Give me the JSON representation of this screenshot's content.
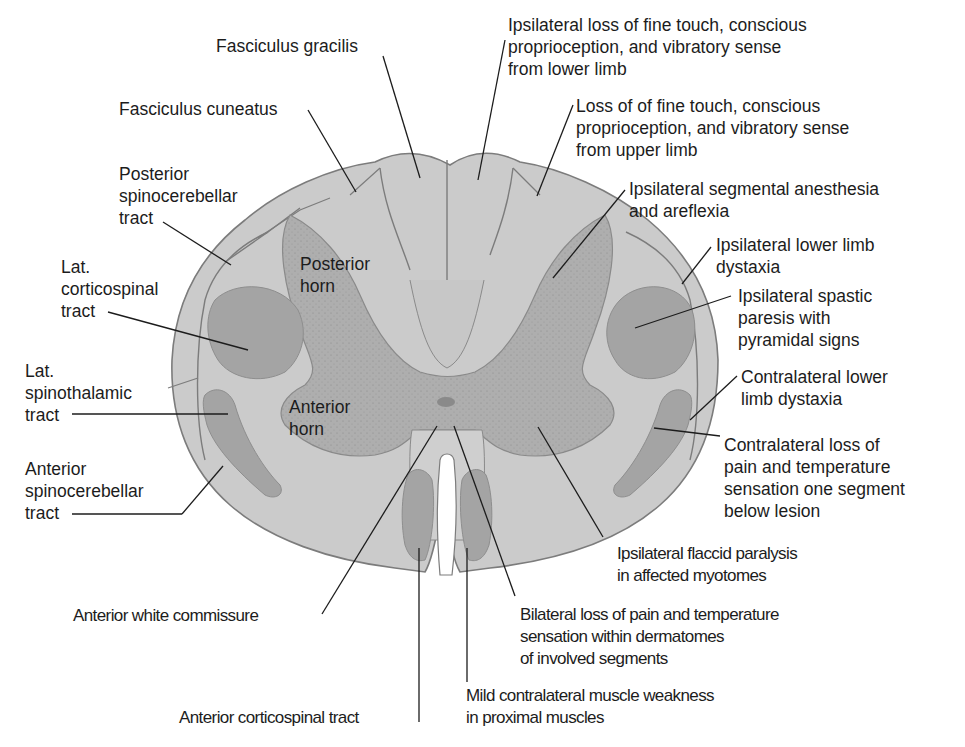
{
  "figure": {
    "colors": {
      "background": "#ffffff",
      "white_matter": "#c9c9c9",
      "white_matter_light": "#d2d2d2",
      "gray_matter": "#adadad",
      "tract_fill": "#a3a3a3",
      "outline": "#7a7a7a",
      "leader_line": "#1c1c1c",
      "central_canal": "#8a8a8a"
    }
  },
  "structures": {
    "posterior_horn": "Posterior\nhorn",
    "anterior_horn": "Anterior\nhorn"
  },
  "left_labels": [
    {
      "id": "fasciculus-gracilis",
      "text": "Fasciculus gracilis"
    },
    {
      "id": "fasciculus-cuneatus",
      "text": "Fasciculus cuneatus"
    },
    {
      "id": "posterior-spinocerebellar-tract",
      "text": "Posterior\nspinocerebellar\ntract"
    },
    {
      "id": "lat-corticospinal-tract",
      "text": "Lat.\ncorticospinal\ntract"
    },
    {
      "id": "lat-spinothalamic-tract",
      "text": "Lat.\nspinothalamic\ntract"
    },
    {
      "id": "anterior-spinocerebellar-tract",
      "text": "Anterior\nspinocerebellar\ntract"
    },
    {
      "id": "anterior-white-commissure",
      "text": "Anterior white commissure"
    },
    {
      "id": "anterior-corticospinal-tract",
      "text": "Anterior corticospinal tract"
    }
  ],
  "right_labels": [
    {
      "id": "deficit-gracilis",
      "text": "Ipsilateral loss of fine touch, conscious\nproprioception, and vibratory sense\nfrom lower limb"
    },
    {
      "id": "deficit-cuneatus",
      "text": "Loss of of fine touch, conscious\nproprioception, and vibratory sense\nfrom upper limb"
    },
    {
      "id": "deficit-posterior-horn",
      "text": "Ipsilateral segmental anesthesia\nand areflexia"
    },
    {
      "id": "deficit-posterior-spinocerebellar",
      "text": "Ipsilateral lower limb\ndystaxia"
    },
    {
      "id": "deficit-lat-corticospinal",
      "text": "Ipsilateral spastic\nparesis with\npyramidal signs"
    },
    {
      "id": "deficit-anterior-spinocerebellar",
      "text": "Contralateral lower\nlimb dystaxia"
    },
    {
      "id": "deficit-lat-spinothalamic",
      "text": "Contralateral loss of\npain and temperature\nsensation one segment\nbelow lesion"
    },
    {
      "id": "deficit-anterior-horn",
      "text": "Ipsilateral flaccid paralysis\nin affected myotomes"
    },
    {
      "id": "deficit-anterior-white-commissure",
      "text": "Bilateral loss of pain and temperature\nsensation within dermatomes\nof involved segments"
    },
    {
      "id": "deficit-anterior-corticospinal",
      "text": "Mild contralateral muscle weakness\nin proximal muscles"
    }
  ]
}
